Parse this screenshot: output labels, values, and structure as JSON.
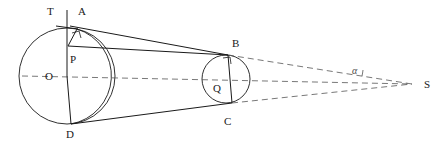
{
  "figure": {
    "width": 441,
    "height": 146,
    "background_color": "#ffffff",
    "stroke_color": "#1a1a1a",
    "dashed_color": "#555555"
  },
  "labels": {
    "T": "T",
    "A": "A",
    "P": "P",
    "O": "O",
    "D": "D",
    "B": "B",
    "Q": "Q",
    "C": "C",
    "S": "S",
    "alpha": "α"
  },
  "label_positions": {
    "T": {
      "x": 47,
      "y": 6
    },
    "A": {
      "x": 78,
      "y": 6
    },
    "P": {
      "x": 70,
      "y": 54
    },
    "O": {
      "x": 45,
      "y": 72
    },
    "D": {
      "x": 66,
      "y": 129
    },
    "B": {
      "x": 232,
      "y": 39
    },
    "Q": {
      "x": 213,
      "y": 84
    },
    "C": {
      "x": 224,
      "y": 117
    },
    "S": {
      "x": 424,
      "y": 79
    },
    "alpha": {
      "x": 352,
      "y": 66
    }
  },
  "geometry": {
    "circle_O": {
      "cx": 67,
      "cy": 76,
      "r": 48
    },
    "circle_Q": {
      "cx": 226,
      "cy": 79,
      "r": 24
    },
    "circle_P": {
      "cx": 81,
      "cy": 76,
      "r": 48
    },
    "points": {
      "T": {
        "x": 67,
        "y": 28
      },
      "A": {
        "x": 77,
        "y": 29
      },
      "P": {
        "x": 68,
        "y": 47
      },
      "O": {
        "x": 67,
        "y": 76
      },
      "D": {
        "x": 71,
        "y": 124
      },
      "B": {
        "x": 228,
        "y": 55
      },
      "Q": {
        "x": 226,
        "y": 79
      },
      "C": {
        "x": 232,
        "y": 103
      },
      "S": {
        "x": 412,
        "y": 84
      }
    },
    "solid_segments": [
      {
        "name": "segment-A-B",
        "from": "A",
        "to": "B"
      },
      {
        "name": "segment-P-B",
        "from": "P",
        "to": "B"
      },
      {
        "name": "segment-D-C",
        "from": "D",
        "to": "C"
      },
      {
        "name": "segment-B-C-chord",
        "from": "B",
        "to": "C"
      },
      {
        "name": "segment-T-D-vertical",
        "from": "T",
        "to": "D"
      },
      {
        "name": "segment-A-D-chord",
        "from": "A",
        "to": "D"
      }
    ],
    "dashed_segments": [
      {
        "name": "axis-O-S",
        "from": "O",
        "to": "S"
      },
      {
        "name": "tangent-B-S",
        "from": "B",
        "to": "S"
      },
      {
        "name": "tangent-C-S",
        "from": "C",
        "to": "S"
      }
    ],
    "right_angle_marks": [
      {
        "name": "right-angle-at-A",
        "x": 76,
        "y": 31
      },
      {
        "name": "right-angle-at-B",
        "x": 227,
        "y": 58
      }
    ]
  }
}
